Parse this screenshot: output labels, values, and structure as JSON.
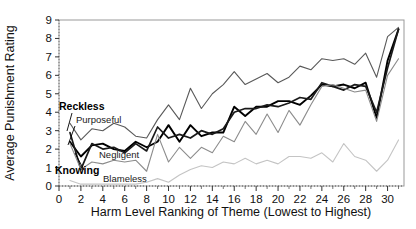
{
  "chart_data": {
    "type": "line",
    "title": "",
    "xlabel": "Harm Level Ranking of Theme (Lowest to Highest)",
    "ylabel": "Average Punishment Rating",
    "xlim": [
      0,
      31.5
    ],
    "ylim": [
      0,
      9
    ],
    "xticks": [
      0,
      2,
      4,
      6,
      8,
      10,
      12,
      14,
      16,
      18,
      20,
      22,
      24,
      26,
      28,
      30
    ],
    "yticks": [
      0,
      1,
      2,
      3,
      4,
      5,
      6,
      7,
      8,
      9
    ],
    "grid": false,
    "legend_position": "inline-annotations",
    "x": [
      1,
      2,
      3,
      4,
      5,
      6,
      7,
      8,
      9,
      10,
      11,
      12,
      13,
      14,
      15,
      16,
      17,
      18,
      19,
      20,
      21,
      22,
      23,
      24,
      25,
      26,
      27,
      28,
      29,
      30,
      31
    ],
    "series": [
      {
        "name": "Purposeful",
        "color": "#595959",
        "width": 1.1,
        "values": [
          3.4,
          2.5,
          3.1,
          3.0,
          3.4,
          3.2,
          2.7,
          2.6,
          3.6,
          4.4,
          3.6,
          5.3,
          4.2,
          5.0,
          5.5,
          6.2,
          5.5,
          5.8,
          6.1,
          5.6,
          5.9,
          6.5,
          6.3,
          6.9,
          6.8,
          6.9,
          6.6,
          7.2,
          5.9,
          8.1,
          8.6
        ]
      },
      {
        "name": "Knowing",
        "color": "#000000",
        "width": 1.9,
        "values": [
          2.4,
          1.6,
          2.2,
          2.3,
          2.0,
          1.9,
          2.4,
          2.1,
          2.4,
          3.3,
          2.4,
          3.3,
          2.7,
          2.9,
          2.9,
          4.3,
          3.8,
          4.3,
          4.3,
          4.6,
          4.6,
          4.4,
          4.9,
          5.5,
          5.4,
          5.5,
          5.3,
          5.6,
          3.7,
          6.8,
          8.5
        ]
      },
      {
        "name": "Reckless",
        "color": "#1a1a1a",
        "width": 1.7,
        "values": [
          2.9,
          0.9,
          2.3,
          2.0,
          2.1,
          1.8,
          2.3,
          1.9,
          3.2,
          2.6,
          2.8,
          2.6,
          3.0,
          2.8,
          3.1,
          4.0,
          4.2,
          4.2,
          4.4,
          4.3,
          4.5,
          4.8,
          4.7,
          5.6,
          5.4,
          5.2,
          5.5,
          5.4,
          4.0,
          6.4,
          8.5
        ]
      },
      {
        "name": "Negligent",
        "color": "#8c8c8c",
        "width": 1.1,
        "values": [
          2.3,
          0.9,
          1.3,
          1.2,
          1.4,
          1.3,
          1.4,
          0.8,
          2.8,
          1.3,
          2.1,
          1.5,
          2.1,
          1.8,
          2.7,
          2.4,
          3.5,
          2.8,
          3.9,
          2.9,
          4.1,
          3.3,
          4.4,
          5.4,
          5.5,
          5.3,
          5.1,
          5.2,
          3.5,
          6.0,
          6.9
        ]
      },
      {
        "name": "Blameless",
        "color": "#c4c4c4",
        "width": 1.1,
        "values": [
          0.3,
          0.1,
          0.1,
          0.1,
          0.1,
          0.1,
          0.1,
          0.2,
          0.4,
          0.2,
          0.6,
          0.9,
          1.1,
          1.0,
          1.3,
          1.2,
          1.5,
          1.2,
          1.4,
          1.2,
          1.6,
          1.6,
          1.5,
          1.8,
          1.3,
          2.3,
          1.6,
          1.4,
          0.8,
          1.4,
          2.5
        ]
      }
    ],
    "annotations": [
      {
        "name": "Reckless",
        "text": "Reckless",
        "bold": true,
        "x": 59,
        "y": 110,
        "anchor": "start"
      },
      {
        "name": "Purposeful",
        "text": "Purposeful",
        "bold": false,
        "x": 76,
        "y": 123,
        "anchor": "start"
      },
      {
        "name": "Negligent",
        "text": "Negligent",
        "bold": false,
        "x": 99,
        "y": 158,
        "anchor": "start"
      },
      {
        "name": "Knowing",
        "text": "Knowing",
        "bold": true,
        "x": 55,
        "y": 174,
        "anchor": "start"
      },
      {
        "name": "Blameless",
        "text": "Blameless",
        "bold": false,
        "x": 103,
        "y": 182,
        "anchor": "start"
      }
    ],
    "leader_lines": [
      {
        "name": "reckless-leader",
        "x1": 72,
        "y1": 113,
        "x2": 67,
        "y2": 131
      },
      {
        "name": "purposeful-leader",
        "x1": 75,
        "y1": 126,
        "x2": 68,
        "y2": 145
      },
      {
        "name": "knowing-leader",
        "x1": 84,
        "y1": 170,
        "x2": 75,
        "y2": 153
      }
    ]
  }
}
